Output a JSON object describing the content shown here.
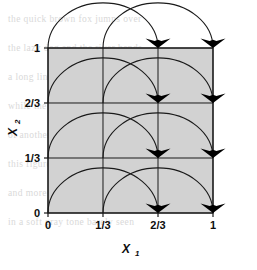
{
  "figure": {
    "title": "",
    "domain": "diagram"
  },
  "axes": {
    "x": {
      "label": "X",
      "subscript": "1",
      "ticks": [
        "0",
        "1/3",
        "2/3",
        "1"
      ],
      "tick_values": [
        0,
        0.3333,
        0.6667,
        1
      ],
      "range": [
        0,
        1
      ]
    },
    "y": {
      "label": "X",
      "subscript": "2",
      "ticks": [
        "0",
        "1/3",
        "2/3",
        "1"
      ],
      "tick_values": [
        0,
        0.3333,
        0.6667,
        1
      ],
      "range": [
        0,
        1
      ]
    }
  },
  "chart_data": {
    "type": "diagram",
    "title": "",
    "xlabel": "X1",
    "ylabel": "X2",
    "xlim": [
      0,
      1
    ],
    "ylim": [
      0,
      1
    ],
    "grid": true,
    "grid_lines_x": [
      0,
      0.3333,
      0.6667,
      1
    ],
    "grid_lines_y": [
      0,
      0.3333,
      0.6667,
      1
    ],
    "fill_color": "#d2d2d2",
    "line_color": "#1a1a1a",
    "arrow_color": "#000000",
    "rows": [
      0,
      0.3333,
      0.6667,
      1
    ],
    "arcs": [
      {
        "row": 0,
        "from_x": 0,
        "to_x": 0.6667,
        "arrow": true
      },
      {
        "row": 0,
        "from_x": 0.3333,
        "to_x": 1,
        "arrow": true
      },
      {
        "row": 0.3333,
        "from_x": 0,
        "to_x": 0.6667,
        "arrow": true
      },
      {
        "row": 0.3333,
        "from_x": 0.3333,
        "to_x": 1,
        "arrow": true
      },
      {
        "row": 0.6667,
        "from_x": 0,
        "to_x": 0.6667,
        "arrow": true
      },
      {
        "row": 0.6667,
        "from_x": 0.3333,
        "to_x": 1,
        "arrow": true
      },
      {
        "row": 1,
        "from_x": 0,
        "to_x": 0.6667,
        "arrow": true
      },
      {
        "row": 1,
        "from_x": 0.3333,
        "to_x": 1,
        "arrow": true
      }
    ],
    "arrow_landing_points": [
      {
        "x": 0.6667,
        "y": 0
      },
      {
        "x": 1,
        "y": 0
      },
      {
        "x": 0.6667,
        "y": 0.3333
      },
      {
        "x": 1,
        "y": 0.3333
      },
      {
        "x": 0.6667,
        "y": 0.6667
      },
      {
        "x": 1,
        "y": 0.6667
      },
      {
        "x": 0.6667,
        "y": 1
      },
      {
        "x": 1,
        "y": 1
      }
    ],
    "shift": "x1 -> x1 + 2/3 (mod 1)"
  },
  "background_artifacts": {
    "note": "faint scanned text bleed-through",
    "lines": [
      "the quick brown fox jumps over",
      "the lazy dog and the river bends",
      "a long line of text appears here",
      "while the margins show faded ink",
      "of another printed page behind",
      "this figure on the reverse side",
      "and more words run along below",
      "in a soft gray tone barely seen"
    ]
  }
}
